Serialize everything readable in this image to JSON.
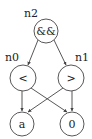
{
  "diagram": {
    "type": "expression-tree",
    "colors": {
      "stroke": "#444444",
      "text": "#222222",
      "background": "#ffffff"
    },
    "nodes": [
      {
        "id": "n2",
        "label": "n2",
        "text": "&&",
        "cx": 46,
        "cy": 31,
        "r": 12
      },
      {
        "id": "n0",
        "label": "n0",
        "text": "<",
        "cx": 23,
        "cy": 78,
        "r": 13
      },
      {
        "id": "n1",
        "label": "n1",
        "text": ">",
        "cx": 71,
        "cy": 78,
        "r": 13
      },
      {
        "id": "a",
        "label": "",
        "text": "a",
        "cx": 22,
        "cy": 124,
        "r": 12
      },
      {
        "id": "zero",
        "label": "",
        "text": "0",
        "cx": 72,
        "cy": 124,
        "r": 12
      }
    ],
    "edges": [
      {
        "from": "n2",
        "to": "n0"
      },
      {
        "from": "n2",
        "to": "n1"
      },
      {
        "from": "n0",
        "to": "a"
      },
      {
        "from": "n0",
        "to": "zero"
      },
      {
        "from": "n1",
        "to": "a"
      },
      {
        "from": "n1",
        "to": "zero"
      }
    ]
  }
}
